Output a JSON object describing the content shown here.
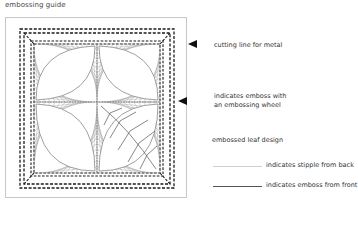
{
  "title": "embossing guide",
  "annotations": [
    {
      "id": "cutting-line",
      "text": "cutting line for metal"
    },
    {
      "id": "emboss-wheel",
      "line1": "indicates emboss with",
      "line2": "an embossing wheel"
    },
    {
      "id": "leaf",
      "text": "embossed leaf design"
    }
  ],
  "legend": [
    {
      "style": "stipple",
      "text": "indicates stipple from back",
      "color": "#cfcfcf"
    },
    {
      "style": "solid",
      "text": "indicates emboss from front",
      "color": "#555555"
    }
  ],
  "colors": {
    "dash": "#1a1a1a",
    "string_art": "#8a8a8a",
    "frame": "#c8c8c8",
    "arrow": "#111111"
  }
}
